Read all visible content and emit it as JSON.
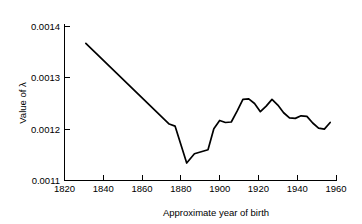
{
  "chart_data": {
    "type": "line",
    "title": "",
    "subtitle": "",
    "xlabel": "Approximate year of birth",
    "ylabel": "Value of λ",
    "xlim": [
      1820,
      1960
    ],
    "ylim": [
      0.0011,
      0.0014
    ],
    "xticks": [
      1820,
      1840,
      1860,
      1880,
      1900,
      1920,
      1940,
      1960
    ],
    "xticklabels": [
      "1820",
      "1840",
      "1860",
      "1880",
      "1900",
      "1920",
      "1940",
      "1960"
    ],
    "yticks": [
      0.0011,
      0.0012,
      0.0013,
      0.0014
    ],
    "yticklabels": [
      "0.0011",
      "0.0012",
      "0.0013",
      "0.0014"
    ],
    "grid": false,
    "legend": false,
    "legend_position": "none",
    "line_color": "#000000",
    "background_color": "#ffffff",
    "series": [
      {
        "name": "lambda",
        "x": [
          1831,
          1874,
          1877,
          1883,
          1887,
          1894,
          1897,
          1900,
          1903,
          1906,
          1909,
          1912,
          1915,
          1918,
          1921,
          1924,
          1927,
          1930,
          1933,
          1936,
          1939,
          1942,
          1945,
          1948,
          1951,
          1954,
          1957
        ],
        "values": [
          0.001367,
          0.00121,
          0.001206,
          0.001134,
          0.001152,
          0.00116,
          0.001201,
          0.001217,
          0.001213,
          0.001214,
          0.001235,
          0.001258,
          0.001259,
          0.00125,
          0.001234,
          0.001245,
          0.001258,
          0.001247,
          0.001232,
          0.001222,
          0.001221,
          0.001226,
          0.001225,
          0.001212,
          0.001202,
          0.0012,
          0.001213
        ]
      }
    ]
  },
  "axis": {
    "y_title": "Value of λ",
    "x_title": "Approximate year of birth"
  }
}
